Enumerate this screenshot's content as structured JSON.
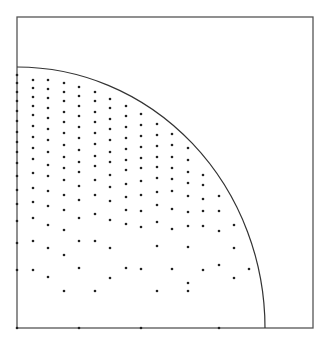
{
  "diagram": {
    "width": 326,
    "height": 338,
    "frame": {
      "x1": 17,
      "y1": 17,
      "x2": 313,
      "y2": 328,
      "color": "#555555"
    },
    "arc": {
      "cx": 17,
      "cy": 328,
      "rx": 248,
      "ry": 261,
      "color": "#333333"
    },
    "dot_color": "#222222",
    "dot_radius": 1.3,
    "columns": [
      {
        "x": 17,
        "ys": [
          75,
          83,
          92,
          101,
          111,
          121,
          132,
          142,
          152,
          163,
          176,
          190,
          204,
          221,
          243,
          270,
          328
        ]
      },
      {
        "x": 33,
        "ys": [
          80,
          88,
          97,
          106,
          115,
          126,
          137,
          148,
          159,
          173,
          188,
          202,
          218,
          241,
          270
        ]
      },
      {
        "x": 48,
        "ys": [
          80,
          89,
          98,
          108,
          118,
          129,
          140,
          152,
          165,
          176,
          191,
          206,
          225,
          248,
          277
        ]
      },
      {
        "x": 64,
        "ys": [
          83,
          92,
          101,
          112,
          122,
          133,
          145,
          157,
          168,
          180,
          195,
          210,
          230,
          255,
          291
        ]
      },
      {
        "x": 79,
        "ys": [
          87,
          96,
          106,
          116,
          127,
          138,
          150,
          162,
          172,
          186,
          200,
          218,
          241,
          268,
          328
        ]
      },
      {
        "x": 95,
        "ys": [
          92,
          101,
          112,
          122,
          133,
          144,
          156,
          166,
          180,
          195,
          214,
          241,
          291
        ]
      },
      {
        "x": 110,
        "ys": [
          99,
          108,
          119,
          129,
          140,
          152,
          162,
          175,
          187,
          201,
          220,
          248,
          278
        ]
      },
      {
        "x": 126,
        "ys": [
          106,
          116,
          127,
          138,
          149,
          160,
          170,
          184,
          197,
          210,
          224,
          268
        ]
      },
      {
        "x": 141,
        "ys": [
          114,
          125,
          136,
          147,
          158,
          168,
          181,
          195,
          211,
          227,
          328,
          269
        ]
      },
      {
        "x": 157,
        "ys": [
          124,
          135,
          146,
          157,
          167,
          178,
          192,
          205,
          222,
          246,
          291
        ]
      },
      {
        "x": 172,
        "ys": [
          134,
          145,
          157,
          168,
          179,
          191,
          209,
          229,
          269
        ]
      },
      {
        "x": 188,
        "ys": [
          148,
          160,
          172,
          183,
          196,
          212,
          226,
          247,
          291,
          283
        ]
      },
      {
        "x": 203,
        "ys": [
          175,
          185,
          199,
          211,
          226,
          270
        ]
      },
      {
        "x": 219,
        "ys": [
          196,
          211,
          231,
          265,
          328
        ]
      },
      {
        "x": 234,
        "ys": [
          225,
          248,
          278
        ]
      },
      {
        "x": 249,
        "ys": [
          269
        ]
      }
    ]
  }
}
